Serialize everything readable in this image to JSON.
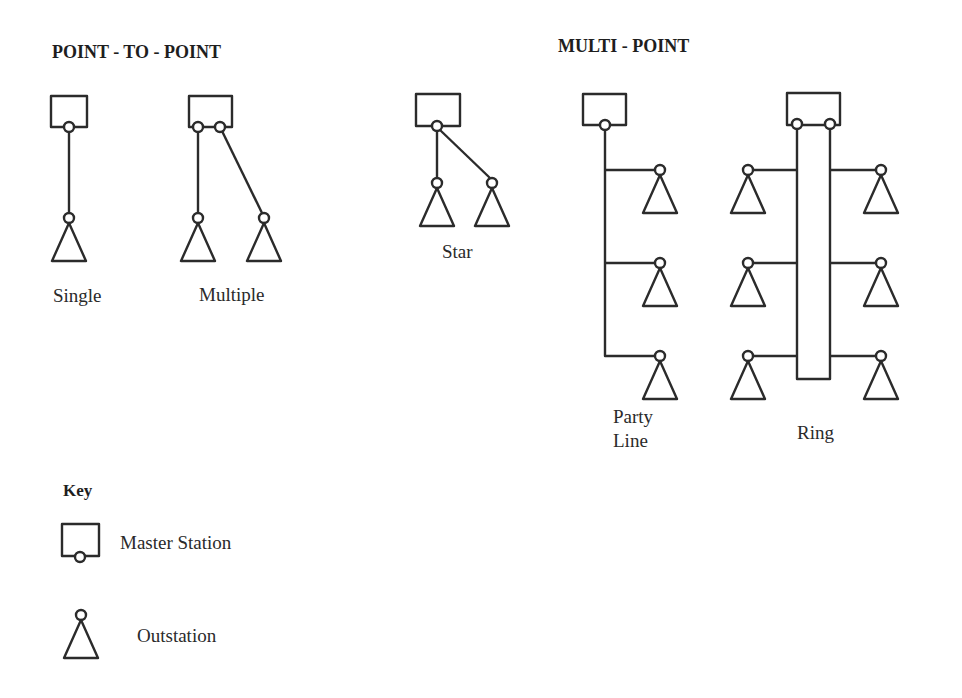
{
  "headings": {
    "point_to_point": "POINT - TO - POINT",
    "multi_point": "MULTI - POINT"
  },
  "topologies": [
    {
      "id": "single",
      "label": "Single",
      "group": "point_to_point",
      "master_stations": 1,
      "outstations": 1
    },
    {
      "id": "multiple",
      "label": "Multiple",
      "group": "point_to_point",
      "master_stations": 1,
      "outstations": 2
    },
    {
      "id": "star",
      "label": "Star",
      "group": "multi_point",
      "master_stations": 1,
      "outstations": 2
    },
    {
      "id": "party_line",
      "label_line1": "Party",
      "label_line2": "Line",
      "group": "multi_point",
      "master_stations": 1,
      "outstations": 3
    },
    {
      "id": "ring",
      "label": "Ring",
      "group": "multi_point",
      "master_stations": 1,
      "outstations": 6
    }
  ],
  "key": {
    "title": "Key",
    "items": [
      {
        "symbol": "master-station-icon",
        "label": "Master Station"
      },
      {
        "symbol": "outstation-icon",
        "label": "Outstation"
      }
    ]
  },
  "colors": {
    "stroke": "#2b2b2b",
    "background": "#ffffff"
  }
}
